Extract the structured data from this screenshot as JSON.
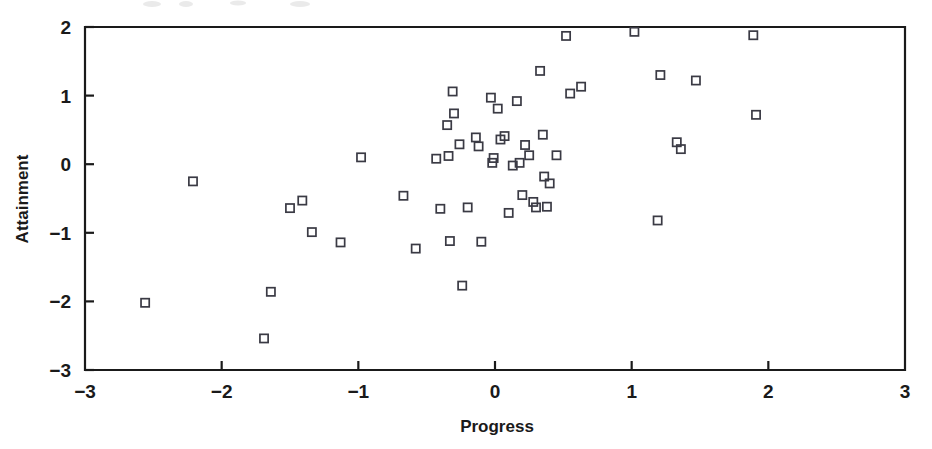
{
  "chart_data": {
    "type": "scatter",
    "title": "",
    "xlabel": "Progress",
    "ylabel": "Attainment",
    "xlim": [
      -3,
      3
    ],
    "ylim": [
      -3,
      2
    ],
    "xticks": [
      -3,
      -2,
      -1,
      0,
      1,
      2,
      3
    ],
    "xtick_labels": [
      "-3",
      "-2",
      "-1",
      "0",
      "1",
      "2",
      "3"
    ],
    "yticks": [
      -3,
      -2,
      -1,
      0,
      1,
      2
    ],
    "ytick_labels": [
      "-3",
      "-2",
      "-1",
      "0",
      "1",
      "2"
    ],
    "grid": false,
    "legend": null,
    "marker": "open-square",
    "marker_color": "#3a3a44",
    "n_points": 56,
    "points": [
      {
        "x": -2.56,
        "y": -2.02
      },
      {
        "x": -2.21,
        "y": -0.25
      },
      {
        "x": -1.69,
        "y": -2.54
      },
      {
        "x": -1.64,
        "y": -1.86
      },
      {
        "x": -1.5,
        "y": -0.64
      },
      {
        "x": -1.41,
        "y": -0.53
      },
      {
        "x": -1.34,
        "y": -0.99
      },
      {
        "x": -1.13,
        "y": -1.14
      },
      {
        "x": -0.98,
        "y": 0.1
      },
      {
        "x": -0.67,
        "y": -0.46
      },
      {
        "x": -0.58,
        "y": -1.23
      },
      {
        "x": -0.4,
        "y": -0.65
      },
      {
        "x": -0.35,
        "y": 0.57
      },
      {
        "x": -0.34,
        "y": 0.12
      },
      {
        "x": -0.33,
        "y": -1.12
      },
      {
        "x": -0.31,
        "y": 1.06
      },
      {
        "x": -0.3,
        "y": 0.74
      },
      {
        "x": -0.26,
        "y": 0.29
      },
      {
        "x": -0.24,
        "y": -1.77
      },
      {
        "x": -0.2,
        "y": -0.63
      },
      {
        "x": -0.14,
        "y": 0.39
      },
      {
        "x": -0.12,
        "y": 0.26
      },
      {
        "x": -0.1,
        "y": -1.13
      },
      {
        "x": -0.03,
        "y": 0.97
      },
      {
        "x": -0.02,
        "y": 0.02
      },
      {
        "x": -0.01,
        "y": 0.09
      },
      {
        "x": 0.02,
        "y": 0.81
      },
      {
        "x": 0.04,
        "y": 0.36
      },
      {
        "x": 0.07,
        "y": 0.41
      },
      {
        "x": 0.1,
        "y": -0.71
      },
      {
        "x": 0.16,
        "y": 0.92
      },
      {
        "x": 0.2,
        "y": -0.45
      },
      {
        "x": 0.22,
        "y": 0.28
      },
      {
        "x": 0.25,
        "y": 0.13
      },
      {
        "x": 0.28,
        "y": -0.55
      },
      {
        "x": 0.3,
        "y": -0.63
      },
      {
        "x": 0.33,
        "y": 1.36
      },
      {
        "x": 0.35,
        "y": 0.43
      },
      {
        "x": 0.36,
        "y": -0.18
      },
      {
        "x": 0.4,
        "y": -0.28
      },
      {
        "x": 0.45,
        "y": 0.13
      },
      {
        "x": 0.52,
        "y": 1.87
      },
      {
        "x": 0.55,
        "y": 1.03
      },
      {
        "x": 0.63,
        "y": 1.13
      },
      {
        "x": 1.02,
        "y": 1.93
      },
      {
        "x": 1.19,
        "y": -0.82
      },
      {
        "x": 1.21,
        "y": 1.3
      },
      {
        "x": 1.33,
        "y": 0.32
      },
      {
        "x": 1.36,
        "y": 0.22
      },
      {
        "x": 1.47,
        "y": 1.22
      },
      {
        "x": 1.89,
        "y": 1.88
      },
      {
        "x": 1.91,
        "y": 0.72
      },
      {
        "x": -0.43,
        "y": 0.08
      },
      {
        "x": 0.13,
        "y": -0.02
      },
      {
        "x": 0.18,
        "y": 0.02
      },
      {
        "x": 0.38,
        "y": -0.62
      }
    ]
  },
  "axes": {
    "x_label": "Progress",
    "y_label": "Attainment"
  }
}
